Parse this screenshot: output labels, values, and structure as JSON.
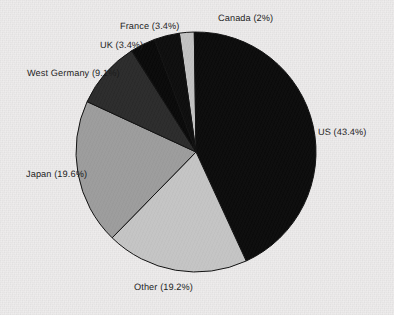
{
  "chart_data": {
    "type": "pie",
    "title": "",
    "subtitle": "",
    "xlabel": "",
    "ylabel": "",
    "legend_position": "none",
    "grid": false,
    "labels_outside": true,
    "start_angle_deg": -98,
    "direction": "clockwise",
    "center": {
      "x": 196,
      "y": 152
    },
    "radius": 120,
    "categories": [
      "Canada",
      "US",
      "Other",
      "Japan",
      "West Germany",
      "UK",
      "France"
    ],
    "values": [
      2,
      43.4,
      19.2,
      19.6,
      9.1,
      3.4,
      3.4
    ],
    "slices": [
      {
        "name": "Canada",
        "label": "Canada (2%)",
        "value": 2,
        "color": "#c2c2c2"
      },
      {
        "name": "US",
        "label": "US (43.4%)",
        "value": 43.4,
        "color": "#0b0b0b"
      },
      {
        "name": "Other",
        "label": "Other (19.2%)",
        "value": 19.2,
        "color": "#c4c4c4"
      },
      {
        "name": "Japan",
        "label": "Japan (19.6%)",
        "value": 19.6,
        "color": "#9c9c9c"
      },
      {
        "name": "West Germany",
        "label": "West Germany (9.1%)",
        "value": 9.1,
        "color": "#2b2b2b"
      },
      {
        "name": "UK",
        "label": "UK (3.4%)",
        "value": 3.4,
        "color": "#090909"
      },
      {
        "name": "France",
        "label": "France (3.4%)",
        "value": 3.4,
        "color": "#0d0d0d"
      }
    ],
    "colors": {
      "us": "#0b0b0b",
      "other": "#c4c4c4",
      "japan": "#9c9c9c",
      "west_germany": "#2b2b2b",
      "uk": "#090909",
      "france": "#0d0d0d",
      "canada": "#c2c2c2",
      "outline": "#111111",
      "background": "#eeecec",
      "label_text": "#1b1b1b"
    }
  }
}
